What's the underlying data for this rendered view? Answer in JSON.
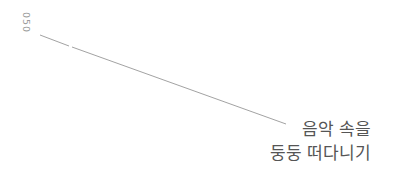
{
  "page_number": "050",
  "title": {
    "line1": "음악 속을",
    "line2": "둥둥 떠다니기"
  },
  "colors": {
    "page_number": "#9a9a9a",
    "leader_line": "#8a8a8a",
    "title_text": "#555555"
  }
}
